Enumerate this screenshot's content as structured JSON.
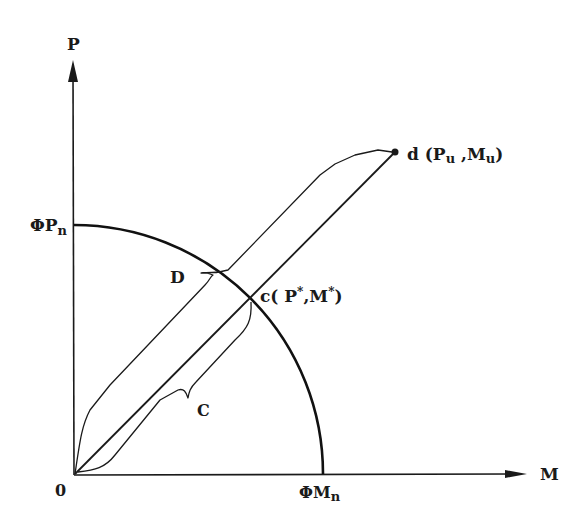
{
  "diagram": {
    "axes": {
      "y_label": "P",
      "x_label": "M",
      "origin_label": "0"
    },
    "limits": {
      "y_intercept_label": "ΦP",
      "y_intercept_sub": "n",
      "x_intercept_label": "ΦM",
      "x_intercept_sub": "n"
    },
    "points": {
      "d_label": "d (P",
      "d_sub1": "u",
      "d_mid": " ,M",
      "d_sub2": "u",
      "d_end": ")",
      "c_label": "c( P",
      "c_sup1": "*",
      "c_mid": ",M",
      "c_sup2": "*",
      "c_end": ")"
    },
    "curve_labels": {
      "upper": "D",
      "lower": "C"
    },
    "colors": {
      "ink": "#1a1a1a",
      "background": "#ffffff"
    }
  }
}
